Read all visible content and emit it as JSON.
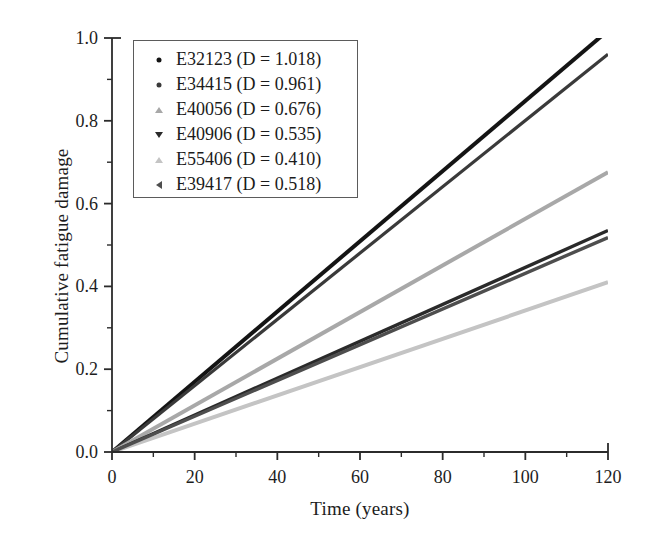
{
  "chart_data": {
    "type": "line",
    "title": "",
    "xlabel": "Time (years)",
    "ylabel": "Cumulative fatigue damage",
    "xlim": [
      0,
      120
    ],
    "ylim": [
      0.0,
      1.0
    ],
    "xticks": [
      0,
      20,
      40,
      60,
      80,
      100,
      120
    ],
    "xtick_labels": [
      "0",
      "20",
      "40",
      "60",
      "80",
      "100",
      "120"
    ],
    "xminor_ticks": [
      10,
      30,
      50,
      70,
      90,
      110
    ],
    "yticks": [
      0.0,
      0.2,
      0.4,
      0.6,
      0.8,
      1.0
    ],
    "ytick_labels": [
      "0.0",
      "0.2",
      "0.4",
      "0.6",
      "0.8",
      "1.0"
    ],
    "yminor_ticks": [
      0.1,
      0.3,
      0.5,
      0.7,
      0.9
    ],
    "grid": false,
    "legend_position": "upper left",
    "x": [
      0,
      120
    ],
    "series": [
      {
        "name": "E32123 (D = 1.018)",
        "label": "E32123",
        "damage": 1.018,
        "values": [
          0.0,
          1.018
        ],
        "marker": "dot",
        "color": "#141414",
        "width": 4.0
      },
      {
        "name": "E34415 (D = 0.961)",
        "label": "E34415",
        "damage": 0.961,
        "values": [
          0.0,
          0.961
        ],
        "marker": "dot",
        "color": "#3a3a3a",
        "width": 3.2
      },
      {
        "name": "E40056 (D = 0.676)",
        "label": "E40056",
        "damage": 0.676,
        "values": [
          0.0,
          0.676
        ],
        "marker": "tri-up",
        "color": "#a8a8a8",
        "width": 4.0
      },
      {
        "name": "E40906 (D = 0.535)",
        "label": "E40906",
        "damage": 0.535,
        "values": [
          0.0,
          0.535
        ],
        "marker": "tri-down",
        "color": "#2a2a2a",
        "width": 3.4
      },
      {
        "name": "E55406 (D = 0.410)",
        "label": "E55406",
        "damage": 0.41,
        "values": [
          0.0,
          0.41
        ],
        "marker": "tri-up",
        "color": "#c4c4c4",
        "width": 4.0
      },
      {
        "name": "E39417 (D = 0.518)",
        "label": "E39417",
        "damage": 0.518,
        "values": [
          0.0,
          0.518
        ],
        "marker": "tri-left",
        "color": "#4e4e4e",
        "width": 3.4
      }
    ]
  },
  "axes": {
    "frame_color": "#2b2b2b",
    "background": "#ffffff"
  }
}
